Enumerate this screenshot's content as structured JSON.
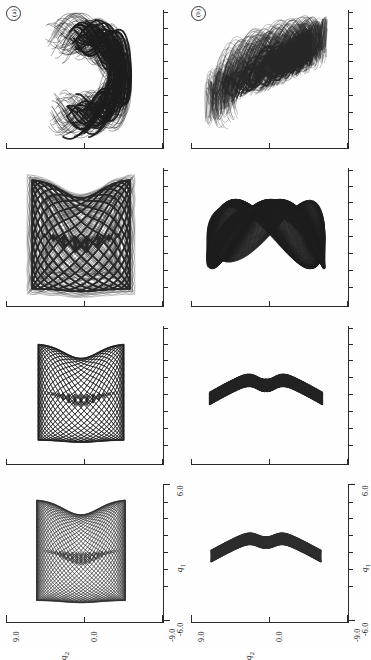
{
  "figure": {
    "orientation": "rotated-90-ccw",
    "background_color": "#fefefe",
    "ink_color": "#111111",
    "axis_color": "#2a2a2a"
  },
  "columns": [
    {
      "key": "a",
      "letter": "(a)"
    },
    {
      "key": "b",
      "letter": "(b)"
    }
  ],
  "axes": {
    "x": {
      "label": "q",
      "sub": "1",
      "min": -6.0,
      "max": 6.0,
      "min_text": "-6.0",
      "max_text": "6.0",
      "ticks": 9
    },
    "y": {
      "label": "q",
      "sub": "2",
      "min": -9.0,
      "max": 9.0,
      "min_text": "-9.0",
      "max_text": "9.0",
      "mid_text": "0.0",
      "ticks": 3
    }
  },
  "chart_data": {
    "type": "scatter",
    "title": "",
    "xlabel": "q1",
    "ylabel": "q2",
    "xlim": [
      -6.0,
      6.0
    ],
    "ylim": [
      -9.0,
      9.0
    ],
    "grid": false,
    "legend": null,
    "panels": [
      {
        "column": "a",
        "row": 1,
        "position": "top",
        "regime": "chaotic",
        "shape": "two-lobed-wishbone",
        "fill": "dense-black-outline-light-interior",
        "extent_q1": [
          -5.2,
          5.4
        ],
        "extent_q2": [
          -6.6,
          6.4
        ],
        "curve_count": 160,
        "description": "Strongly smeared band pair forming an upward wishbone with a crossing X near the lower centre."
      },
      {
        "column": "a",
        "row": 2,
        "regime": "quasi-periodic-thickening",
        "shape": "rounded-bucket-with-lower-cusp",
        "fill": "dark-boundary-faint-mesh",
        "extent_q1": [
          -5.0,
          5.0
        ],
        "extent_q2": [
          -6.4,
          6.2
        ],
        "curve_count": 120,
        "description": "Bucket-shaped torus with thick dark rim and a faint interior mesh, pinched into a V-cusp at the lower edge."
      },
      {
        "column": "a",
        "row": 3,
        "regime": "regular",
        "shape": "lattice-bucket",
        "fill": "open-diamond-lattice",
        "extent_q1": [
          -4.4,
          4.4
        ],
        "extent_q2": [
          -5.6,
          5.6
        ],
        "curve_count": 44,
        "description": "Clean crosshatched diamond lattice filling a bucket outline, two families of curves intersecting regularly."
      },
      {
        "column": "a",
        "row": 4,
        "position": "bottom",
        "regime": "regular",
        "shape": "fine-lattice-bucket",
        "fill": "fine-diamond-lattice",
        "extent_q1": [
          -4.6,
          4.6
        ],
        "extent_q2": [
          -5.8,
          5.8
        ],
        "curve_count": 64,
        "description": "Denser, finer diamond lattice of the same bucket shape; interior nearly uniformly covered."
      },
      {
        "column": "b",
        "row": 1,
        "position": "top",
        "regime": "fully-chaotic",
        "shape": "broad-butterfly-spray",
        "fill": "filamentary-black-streaks",
        "extent_q1": [
          -4.6,
          4.6
        ],
        "extent_q2": [
          -8.0,
          8.0
        ],
        "curve_count": 220,
        "description": "Wide chaotic spray of filaments radiating from a dense dark core, wings sweeping left and right."
      },
      {
        "column": "b",
        "row": 2,
        "regime": "chaotic-onset",
        "shape": "bowtie-crossing-loops",
        "fill": "thick-outlined-loops",
        "extent_q1": [
          -3.8,
          3.8
        ],
        "extent_q2": [
          -7.6,
          7.6
        ],
        "curve_count": 38,
        "description": "A few heavy crossing loops forming a bowtie / figure-eight pattern with an open central X."
      },
      {
        "column": "b",
        "row": 3,
        "regime": "quasi-periodic",
        "shape": "shallow-arch-with-central-cusp",
        "fill": "banded-crosshatch",
        "extent_q1": [
          -3.4,
          3.4
        ],
        "extent_q2": [
          -7.4,
          7.4
        ],
        "curve_count": 90,
        "description": "Shallow arch band, thick dark rim, crosshatched interior, with a sharp downward cusp at the centre."
      },
      {
        "column": "b",
        "row": 4,
        "position": "bottom",
        "regime": "regular",
        "shape": "arch-band-with-central-cusp",
        "fill": "light-crosshatch",
        "extent_q1": [
          -3.2,
          3.2
        ],
        "extent_q2": [
          -7.2,
          7.2
        ],
        "curve_count": 70,
        "description": "Smooth arch-shaped band with light crosshatching and a V cusp at the centre bottom."
      }
    ]
  }
}
